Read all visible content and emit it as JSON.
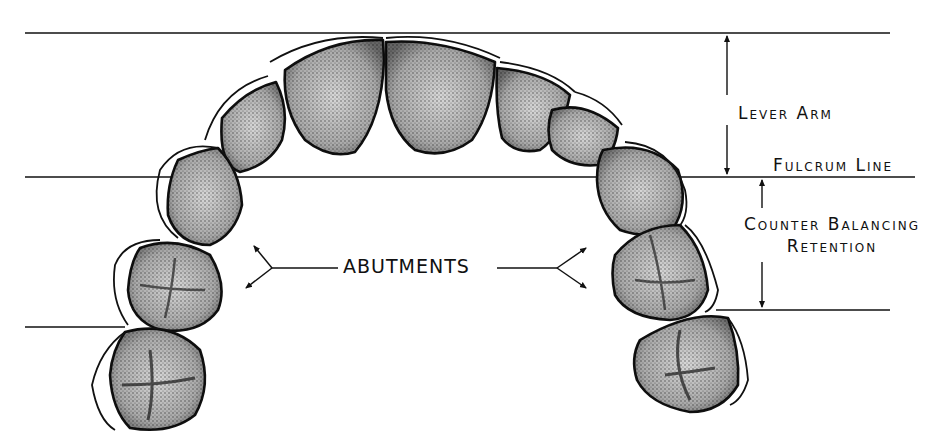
{
  "figure": {
    "type": "dental arch diagram",
    "labels": {
      "lever_arm": "Lever Arm",
      "fulcrum_line": "Fulcrum Line",
      "counter_balancing": "Counter Balancing",
      "retention": "Retention",
      "abutments": "ABUTMENTS"
    },
    "reference_lines": [
      {
        "name": "incisal-line",
        "y": 33
      },
      {
        "name": "fulcrum-line",
        "y": 177
      },
      {
        "name": "left-distal-line",
        "y": 327
      },
      {
        "name": "right-distal-line",
        "y": 310
      }
    ],
    "colors": {
      "ink": "#111111",
      "tooth_fill": "#d8d8d8",
      "background": "#ffffff"
    }
  }
}
